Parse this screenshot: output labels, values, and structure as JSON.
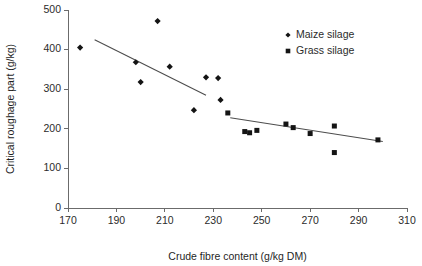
{
  "chart_data": {
    "type": "scatter",
    "title": "",
    "xlabel": "Crude fibre content (g/kg DM)",
    "ylabel": "Critical roughage part (g/kg)",
    "xlim": [
      170,
      310
    ],
    "ylim": [
      0,
      500
    ],
    "xticks": [
      170,
      190,
      210,
      230,
      250,
      270,
      290,
      310
    ],
    "yticks": [
      0,
      100,
      200,
      300,
      400,
      500
    ],
    "grid": false,
    "legend_position": "top-right",
    "series": [
      {
        "name": "Maize silage",
        "marker": "diamond",
        "color": "#141414",
        "points": [
          [
            175,
            405
          ],
          [
            198,
            368
          ],
          [
            200,
            318
          ],
          [
            207,
            472
          ],
          [
            212,
            357
          ],
          [
            222,
            247
          ],
          [
            227,
            330
          ],
          [
            232,
            328
          ],
          [
            233,
            273
          ]
        ],
        "trendline": {
          "x0": 181,
          "y0": 425,
          "x1": 227,
          "y1": 285
        }
      },
      {
        "name": "Grass silage",
        "marker": "square",
        "color": "#141414",
        "points": [
          [
            236,
            240
          ],
          [
            243,
            193
          ],
          [
            245,
            190
          ],
          [
            248,
            196
          ],
          [
            260,
            212
          ],
          [
            263,
            203
          ],
          [
            270,
            188
          ],
          [
            280,
            207
          ],
          [
            280,
            140
          ],
          [
            298,
            172
          ]
        ],
        "trendline": {
          "x0": 237,
          "y0": 228,
          "x1": 300,
          "y1": 168
        }
      }
    ]
  },
  "axes": {
    "x_tick_labels": [
      "170",
      "190",
      "210",
      "230",
      "250",
      "270",
      "290",
      "310"
    ],
    "y_tick_labels": [
      "0",
      "100",
      "200",
      "300",
      "400",
      "500"
    ],
    "x_title": "Crude fibre content (g/kg DM)",
    "y_title": "Critical roughage part (g/kg)"
  },
  "legend": {
    "items": [
      {
        "label": "Maize silage",
        "marker": "diamond"
      },
      {
        "label": "Grass silage",
        "marker": "square"
      }
    ]
  }
}
